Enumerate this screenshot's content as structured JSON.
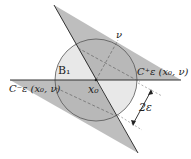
{
  "diagram": {
    "labels": {
      "ball": "B₁",
      "center": "x₀",
      "normal": "ν",
      "cone_plus": "C⁺ε (x₀, ν)",
      "cone_minus": "C⁻ε (x₀, ν)",
      "width": "2ε"
    },
    "colors": {
      "shade": "#b9b9b9",
      "circle_fill": "#e6e6e6",
      "line": "#444444",
      "dash": "#777777"
    }
  }
}
